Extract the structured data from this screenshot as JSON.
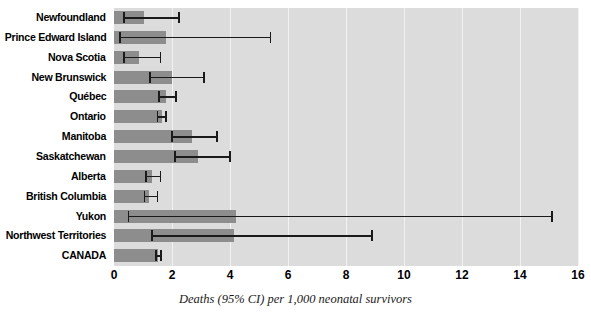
{
  "chart_data": {
    "type": "bar",
    "orientation": "horizontal",
    "title": "",
    "xlabel": "Deaths (95% CI) per 1,000 neonatal survivors",
    "ylabel": "",
    "xlim": [
      0,
      16
    ],
    "xticks": [
      0,
      2,
      4,
      6,
      8,
      10,
      12,
      14,
      16
    ],
    "grid": true,
    "legend": "none",
    "error_bars": "95% CI",
    "categories": [
      "Newfoundland",
      "Prince Edward Island",
      "Nova Scotia",
      "New Brunswick",
      "Québec",
      "Ontario",
      "Manitoba",
      "Saskatchewan",
      "Alberta",
      "British Columbia",
      "Yukon",
      "Northwest Territories",
      "CANADA"
    ],
    "values": [
      1.05,
      1.8,
      0.85,
      2.0,
      1.8,
      1.65,
      2.7,
      2.9,
      1.3,
      1.2,
      4.2,
      4.15,
      1.5
    ],
    "ci_low": [
      0.35,
      0.2,
      0.35,
      1.25,
      1.55,
      1.5,
      2.0,
      2.1,
      1.1,
      1.05,
      0.5,
      1.3,
      1.45
    ],
    "ci_high": [
      2.25,
      5.4,
      1.6,
      3.1,
      2.15,
      1.8,
      3.55,
      4.0,
      1.6,
      1.5,
      15.1,
      8.9,
      1.62
    ],
    "colors": {
      "bar": "#8d8d8d",
      "plot_background": "#dcdcdc",
      "gridline": "#f2f2f2",
      "error_bar": "#1a1a1a",
      "text": "#000000",
      "page_background": "#ffffff"
    }
  }
}
